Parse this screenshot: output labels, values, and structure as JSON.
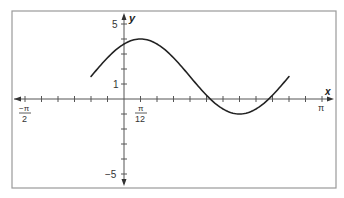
{
  "chart_data": {
    "type": "line",
    "title": "",
    "xlabel": "x",
    "ylabel": "y",
    "function": "y = 1.5 + 2.5 sin(2(x + π/6))",
    "domain": [
      "-π/6",
      "5π/6"
    ],
    "xlim": [
      "-π/2",
      "π"
    ],
    "ylim": [
      -5,
      5
    ],
    "x_tick_step": "π/12",
    "y_tick_step": 1,
    "x_tick_labels": [
      {
        "pos": "-π/2",
        "num": "−π",
        "den": "2"
      },
      {
        "pos": "π/12",
        "num": "π",
        "den": "12"
      },
      {
        "pos": "π",
        "text": "π"
      }
    ],
    "y_tick_labels": [
      {
        "value": 5,
        "text": "5"
      },
      {
        "value": 1,
        "text": "1"
      },
      {
        "value": -5,
        "text": "−5"
      }
    ],
    "key_points": [
      {
        "x": "-π/6",
        "y": 1.5
      },
      {
        "x": "π/12",
        "y": 4,
        "note": "maximum"
      },
      {
        "x": "7π/12",
        "y": -1,
        "note": "minimum"
      },
      {
        "x": "5π/6",
        "y": 1.5
      }
    ],
    "grid": false,
    "legend": null
  },
  "labels": {
    "x_axis": "x",
    "y_axis": "y",
    "y5": "5",
    "y1": "1",
    "yneg5": "−5",
    "xneg_pi_num": "−π",
    "xneg_pi_den": "2",
    "x_pi12_num": "π",
    "x_pi12_den": "12",
    "x_pi": "π"
  },
  "colors": {
    "frame": "#9a9a9a",
    "axis": "#444444",
    "curve": "#222222"
  }
}
